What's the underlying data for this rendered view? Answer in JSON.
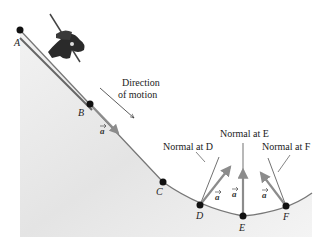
{
  "diagram": {
    "direction_label_line1": "Direction",
    "direction_label_line2": "of motion",
    "points": [
      {
        "id": "A",
        "label": "A"
      },
      {
        "id": "B",
        "label": "B"
      },
      {
        "id": "C",
        "label": "C"
      },
      {
        "id": "D",
        "label": "D"
      },
      {
        "id": "E",
        "label": "E"
      },
      {
        "id": "F",
        "label": "F"
      }
    ],
    "normals": [
      {
        "at": "D",
        "label": "Normal at D"
      },
      {
        "at": "E",
        "label": "Normal at E"
      },
      {
        "at": "F",
        "label": "Normal at F"
      }
    ],
    "accel_vectors": [
      {
        "at": "B",
        "label": "a"
      },
      {
        "at": "D",
        "label": "a"
      },
      {
        "at": "E",
        "label": "a"
      },
      {
        "at": "F",
        "label": "a"
      }
    ],
    "colors": {
      "ground": "#e6e6e6",
      "track": "#777777",
      "vector": "#8c8c8c",
      "point": "#111111"
    }
  }
}
